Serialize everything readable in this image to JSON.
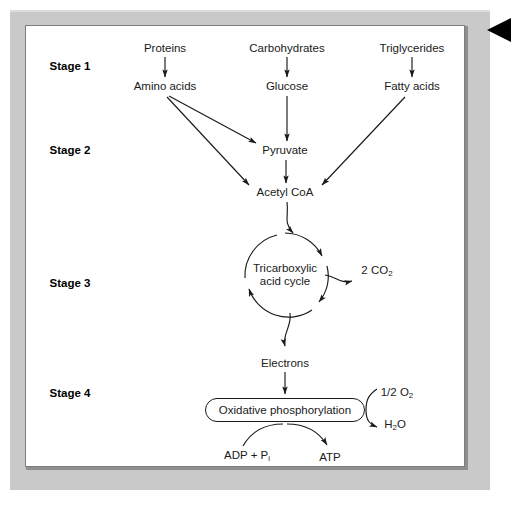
{
  "figure": {
    "page_marker_icon": "left-pointing-triangle-icon"
  },
  "stages": [
    {
      "label": "Stage 1"
    },
    {
      "label": "Stage 2"
    },
    {
      "label": "Stage 3"
    },
    {
      "label": "Stage 4"
    }
  ],
  "nodes": {
    "proteins": "Proteins",
    "carbohydrates": "Carbohydrates",
    "triglycerides": "Triglycerides",
    "amino_acids": "Amino acids",
    "glucose": "Glucose",
    "fatty_acids": "Fatty acids",
    "pyruvate": "Pyruvate",
    "acetyl_coa": "Acetyl CoA",
    "tca_line1": "Tricarboxylic",
    "tca_line2": "acid cycle",
    "electrons": "Electrons",
    "oxidative_phosphorylation": "Oxidative phosphorylation",
    "atp": "ATP"
  },
  "chemicals": {
    "co2": {
      "coefficient": "2 ",
      "formula": "CO",
      "subscript": "2"
    },
    "o2": {
      "coefficient": "1/2 ",
      "formula": "O",
      "subscript": "2"
    },
    "h2o": {
      "prefix": "H",
      "subscript": "2",
      "suffix": "O"
    },
    "adp_pi": {
      "prefix": "ADP + P",
      "subscript": "i"
    }
  },
  "colors": {
    "frame_gray": "#c9c9c9",
    "frame_shadow": "#8f8f8f",
    "canvas": "#ffffff",
    "ink": "#1a1a1a",
    "marker": "#000000"
  }
}
